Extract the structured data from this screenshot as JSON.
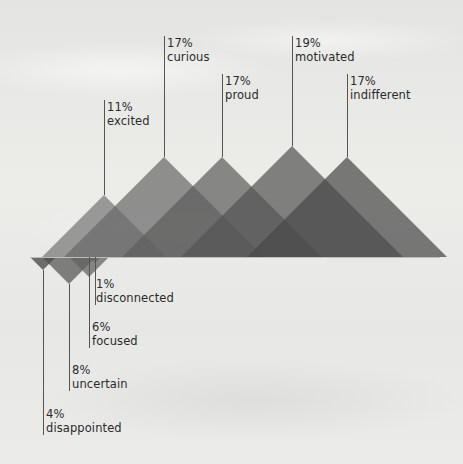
{
  "chart_data": {
    "type": "area",
    "title": "",
    "xlabel": "",
    "ylabel": "",
    "legend": "none",
    "grid": false,
    "baseline_y_px": 257,
    "categories": [
      "excited",
      "curious",
      "proud",
      "motivated",
      "indifferent",
      "disconnected",
      "focused",
      "uncertain",
      "disappointed"
    ],
    "values": [
      11,
      17,
      17,
      19,
      17,
      1,
      6,
      8,
      4
    ],
    "units": "%",
    "above_baseline": [
      {
        "label": "excited",
        "value": 11,
        "apex": [
          104,
          195
        ],
        "color": "#777777"
      },
      {
        "label": "curious",
        "value": 17,
        "apex": [
          164,
          157
        ],
        "color": "#6a6a6a"
      },
      {
        "label": "proud",
        "value": 17,
        "apex": [
          222,
          157
        ],
        "color": "#5e5e5e"
      },
      {
        "label": "motivated",
        "value": 19,
        "apex": [
          292,
          146
        ],
        "color": "#545454"
      },
      {
        "label": "indifferent",
        "value": 17,
        "apex": [
          347,
          157
        ],
        "color": "#4a4a4a"
      }
    ],
    "below_baseline": [
      {
        "label": "disconnected",
        "value": 1,
        "apex": [
          95,
          263
        ],
        "color": "#5a5a5a"
      },
      {
        "label": "focused",
        "value": 6,
        "apex": [
          89,
          277
        ],
        "color": "#6c6c6c"
      },
      {
        "label": "uncertain",
        "value": 8,
        "apex": [
          69,
          284
        ],
        "color": "#626262"
      },
      {
        "label": "disappointed",
        "value": 4,
        "apex": [
          43,
          270
        ],
        "color": "#4e4e4e"
      }
    ]
  },
  "labels": {
    "excited": {
      "pct": "11%",
      "name": "excited"
    },
    "curious": {
      "pct": "17%",
      "name": "curious"
    },
    "proud": {
      "pct": "17%",
      "name": "proud"
    },
    "motivated": {
      "pct": "19%",
      "name": "motivated"
    },
    "indifferent": {
      "pct": "17%",
      "name": "indifferent"
    },
    "disconnected": {
      "pct": "1%",
      "name": "disconnected"
    },
    "focused": {
      "pct": "6%",
      "name": "focused"
    },
    "uncertain": {
      "pct": "8%",
      "name": "uncertain"
    },
    "disappointed": {
      "pct": "4%",
      "name": "disappointed"
    }
  },
  "colors": {
    "leader_line": "#555555",
    "text": "#2b2b2b",
    "baseline": "#bdbdbb"
  }
}
